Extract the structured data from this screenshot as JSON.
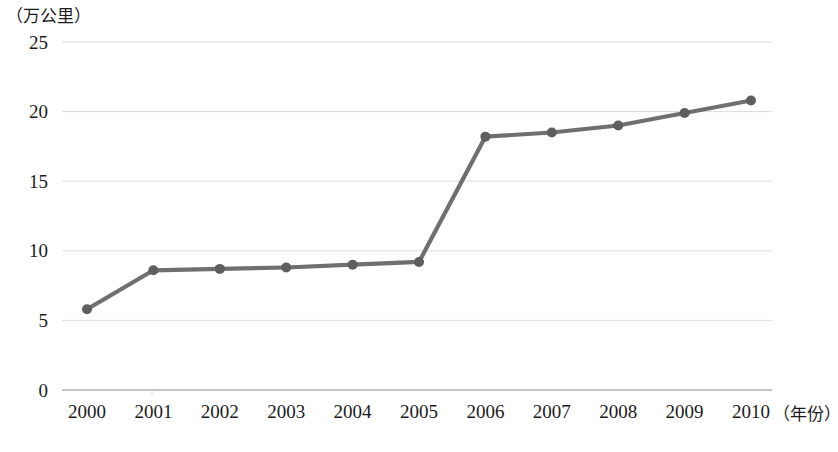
{
  "chart_data": {
    "type": "line",
    "title": "",
    "xlabel": "（年份）",
    "ylabel": "（万公里）",
    "categories": [
      "2000",
      "2001",
      "2002",
      "2003",
      "2004",
      "2005",
      "2006",
      "2007",
      "2008",
      "2009",
      "2010"
    ],
    "values": [
      5.8,
      8.6,
      8.7,
      8.8,
      9.0,
      9.2,
      18.2,
      18.5,
      19.0,
      19.9,
      20.8
    ],
    "series": [
      {
        "name": "",
        "values": [
          5.8,
          8.6,
          8.7,
          8.8,
          9.0,
          9.2,
          18.2,
          18.5,
          19.0,
          19.9,
          20.8
        ]
      }
    ],
    "ylim": [
      0,
      25
    ],
    "yticks": [
      0,
      5,
      10,
      15,
      20,
      25
    ],
    "ytick_labels": [
      "0",
      "5",
      "10",
      "15",
      "20",
      "25"
    ],
    "grid": true,
    "grid_axis": "y",
    "legend": false,
    "legend_position": "none",
    "marker": "circle",
    "line_color": "#6f6f6f",
    "marker_color": "#5e5e5e",
    "grid_color": "#d8d8d8",
    "axis_color": "#8a8a8a"
  }
}
